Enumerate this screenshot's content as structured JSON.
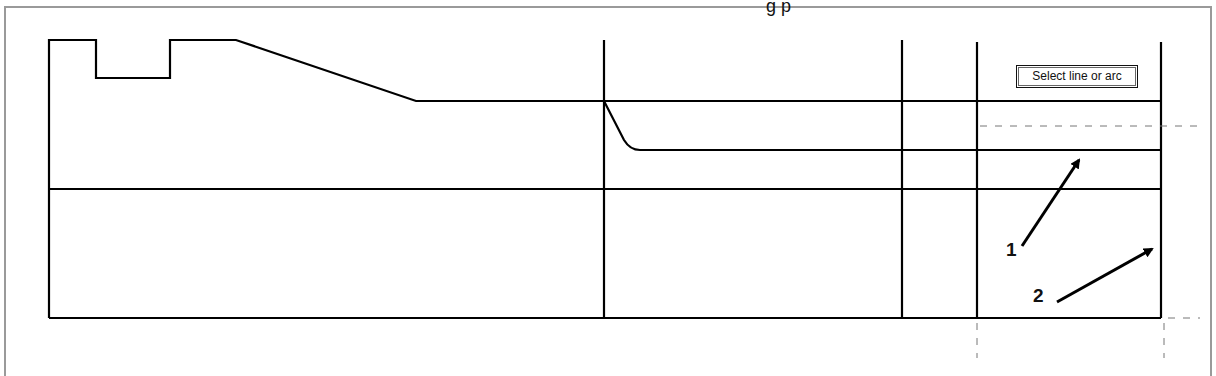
{
  "window": {
    "cut_title_fragment": "g                p"
  },
  "canvas": {
    "stroke_color": "#000000",
    "frame_color": "#9a9a9a",
    "profile_points": "49,318 49,40 96,40 96,78 170,78 170,40 236,40 416,101 1161,101",
    "vertical_lines": [
      {
        "x": 604,
        "y1": 40,
        "y2": 318
      },
      {
        "x": 902,
        "y1": 40,
        "y2": 318
      },
      {
        "x": 977,
        "y1": 42,
        "y2": 318
      },
      {
        "x": 1161,
        "y1": 42,
        "y2": 318
      }
    ],
    "horizontal_lines": [
      {
        "y": 189,
        "x1": 49,
        "x2": 1161
      },
      {
        "y": 318,
        "x1": 49,
        "x2": 1161
      }
    ],
    "curve_path": "M604,101 L624,140 Q630,150 640,150 L1161,150",
    "dashed_lines": [
      {
        "x1": 980,
        "y1": 126,
        "x2": 1200,
        "y2": 126
      },
      {
        "x1": 1168,
        "y1": 318,
        "x2": 1200,
        "y2": 318
      },
      {
        "x1": 977,
        "y1": 323,
        "x2": 977,
        "y2": 358
      },
      {
        "x1": 1164,
        "y1": 323,
        "x2": 1164,
        "y2": 358
      }
    ]
  },
  "tooltip": {
    "text": "Select line or arc"
  },
  "annotations": [
    {
      "label": "1",
      "x": 1006,
      "y": 239,
      "arrow": {
        "x1": 1022,
        "y1": 246,
        "x2": 1079,
        "y2": 160
      }
    },
    {
      "label": "2",
      "x": 1033,
      "y": 285,
      "arrow": {
        "x1": 1057,
        "y1": 302,
        "x2": 1152,
        "y2": 249
      }
    }
  ]
}
